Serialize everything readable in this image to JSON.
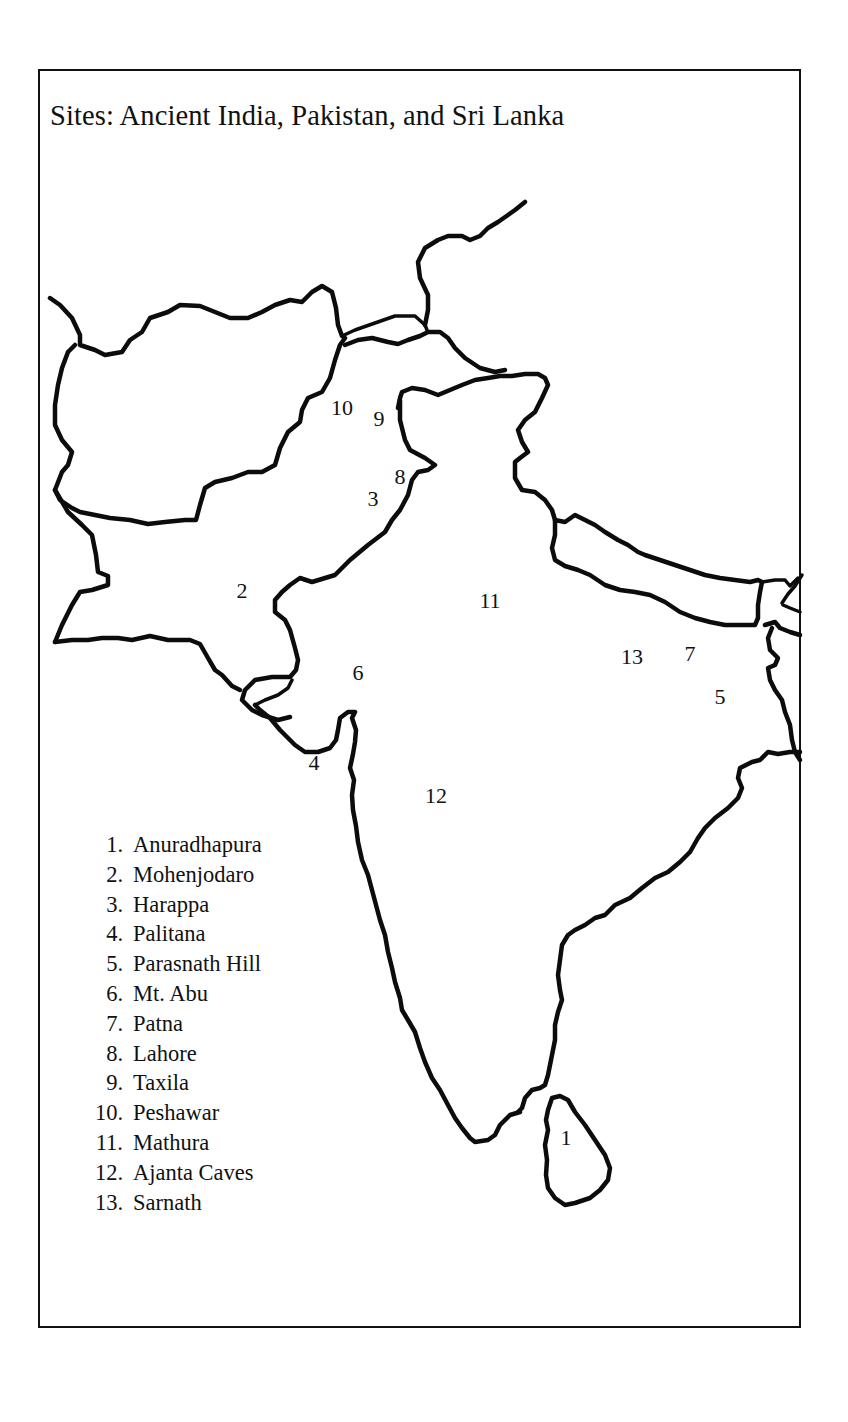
{
  "map": {
    "title": "Sites: Ancient India, Pakistan, and Sri Lanka",
    "markers": [
      {
        "id": "1",
        "x": 566,
        "y": 1138
      },
      {
        "id": "2",
        "x": 242,
        "y": 591
      },
      {
        "id": "3",
        "x": 373,
        "y": 499
      },
      {
        "id": "4",
        "x": 314,
        "y": 763
      },
      {
        "id": "5",
        "x": 720,
        "y": 697
      },
      {
        "id": "6",
        "x": 358,
        "y": 673
      },
      {
        "id": "7",
        "x": 690,
        "y": 654
      },
      {
        "id": "8",
        "x": 400,
        "y": 477
      },
      {
        "id": "9",
        "x": 379,
        "y": 419
      },
      {
        "id": "10",
        "x": 342,
        "y": 408
      },
      {
        "id": "11",
        "x": 490,
        "y": 601
      },
      {
        "id": "12",
        "x": 436,
        "y": 796
      },
      {
        "id": "13",
        "x": 632,
        "y": 657
      }
    ],
    "legend": [
      {
        "num": "1.",
        "label": "Anuradhapura"
      },
      {
        "num": "2.",
        "label": "Mohenjodaro"
      },
      {
        "num": "3.",
        "label": "Harappa"
      },
      {
        "num": "4.",
        "label": "Palitana"
      },
      {
        "num": "5.",
        "label": "Parasnath Hill"
      },
      {
        "num": "6.",
        "label": "Mt. Abu"
      },
      {
        "num": "7.",
        "label": "Patna"
      },
      {
        "num": "8.",
        "label": "Lahore"
      },
      {
        "num": "9.",
        "label": "Taxila"
      },
      {
        "num": "10.",
        "label": "Peshawar"
      },
      {
        "num": "11.",
        "label": "Mathura"
      },
      {
        "num": "12.",
        "label": "Ajanta Caves"
      },
      {
        "num": "13.",
        "label": "Sarnath"
      }
    ],
    "regions": [
      "Afghanistan",
      "Pakistan",
      "India",
      "Nepal",
      "Sri Lanka",
      "Bangladesh"
    ],
    "colors": {
      "ink": "#0c0c0c",
      "paper": "#ffffff"
    }
  }
}
